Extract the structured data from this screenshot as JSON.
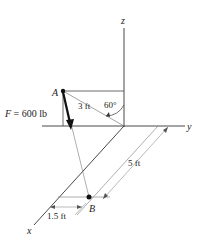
{
  "axes": {
    "z_label": "z",
    "y_label": "y",
    "x_label": "x"
  },
  "points": {
    "A": "A",
    "B": "B"
  },
  "force": {
    "symbol": "F",
    "label": "F = 600 lb",
    "value_text": " = 600 lb"
  },
  "dimensions": {
    "arm_length": "3 ft",
    "angle": "60°",
    "along_y_offset": "5 ft",
    "along_x_offset": "1.5 ft"
  },
  "colors": {
    "line": "#333333",
    "light_line": "#777777",
    "text": "#222222",
    "background": "#ffffff"
  }
}
